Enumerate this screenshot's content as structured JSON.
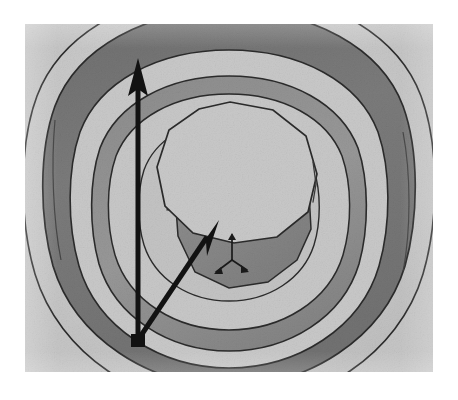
{
  "image": {
    "kind": "scanned-grayscale-cad-render",
    "subject": "axisymmetric-cup-with-central-boss",
    "canvas": {
      "width": 458,
      "height": 400
    },
    "content_frame": {
      "x": 25,
      "y": 24,
      "width": 408,
      "height": 348
    },
    "page_background": "#ffffff"
  },
  "palette": {
    "paper_white": "#ffffff",
    "base_gray": "#c6c6c6",
    "light_face": "#c8c8c8",
    "mid_face": "#b4b4b4",
    "mid_dark_face": "#8a8a8a",
    "dark_face": "#747474",
    "darkest_face": "#6e6e6e",
    "edge_line": "#2b2b2b",
    "annotation_black": "#121212"
  },
  "geometry": {
    "description": "Nested concentric toroidal rings forming a stepped bowl, with a decagonal central boss rising from the floor.",
    "rings": [
      {
        "name": "outer-rim-top",
        "shade": "#bfbfbf",
        "note": "outermost light rim band"
      },
      {
        "name": "outer-wall-dark",
        "shade": "#747474",
        "note": "shaded outer wall band"
      },
      {
        "name": "upper-shelf",
        "shade": "#c8c8c8",
        "note": "light annular shelf"
      },
      {
        "name": "mid-wall-dark",
        "shade": "#8f8f8f",
        "note": "second shaded wall band"
      },
      {
        "name": "inner-floor",
        "shade": "#c4c4c4",
        "note": "light inner floor"
      }
    ],
    "central_boss": {
      "name": "decagonal-boss",
      "top_face_shade": "#c8c8c8",
      "side_face_shade": "#8a8a8a",
      "sides": 10
    }
  },
  "annotations": {
    "origin_point": {
      "x": 138,
      "y": 340,
      "label": "shared-arrow-origin"
    },
    "arrows": [
      {
        "name": "vertical-axis-arrow",
        "from": {
          "x": 138,
          "y": 340
        },
        "to": {
          "x": 138,
          "y": 58
        },
        "color": "#121212",
        "shaft_width": 5,
        "head_length": 30,
        "head_width": 20
      },
      {
        "name": "diagonal-axis-arrow",
        "from": {
          "x": 138,
          "y": 340
        },
        "to": {
          "x": 219,
          "y": 220
        },
        "color": "#121212",
        "shaft_width": 5,
        "head_length": 28,
        "head_width": 19
      }
    ],
    "coordinate_triad": {
      "name": "small-3d-axis-triad",
      "position": {
        "x": 232,
        "y": 245
      },
      "color": "#1a1a1a",
      "axes": [
        "up",
        "down-left",
        "down-right"
      ],
      "scale": 1
    }
  },
  "text": {
    "labels": [],
    "note": "No legible text, axis labels, legend, or caption is present in the scanned image."
  }
}
